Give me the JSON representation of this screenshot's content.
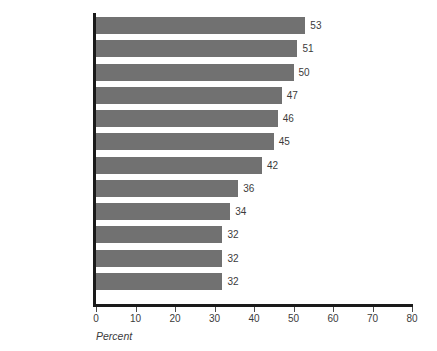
{
  "chart_data": {
    "type": "bar",
    "orientation": "horizontal",
    "title": "",
    "xlabel": "Percent",
    "ylabel": "",
    "categories": [
      "Netherlands",
      "Japan",
      "Sweden",
      "Italy",
      "Germany",
      "Finland",
      "France",
      "Denmark",
      "United States",
      "United Kingdom",
      "Canada",
      "Norway"
    ],
    "values": [
      53,
      51,
      50,
      47,
      46,
      45,
      42,
      36,
      34,
      32,
      32,
      32
    ],
    "value_labels": [
      "53",
      "51",
      "50",
      "47",
      "46",
      "45",
      "42",
      "36",
      "34",
      "32",
      "32",
      "32"
    ],
    "xlim": [
      0,
      80
    ],
    "xticks": [
      0,
      10,
      20,
      30,
      40,
      50,
      60,
      70,
      80
    ],
    "xtick_labels": [
      "0",
      "10",
      "20",
      "30",
      "40",
      "50",
      "60",
      "70",
      "80"
    ],
    "grid": false,
    "legend": null,
    "bar_color": "#717171",
    "axis_color": "#1a1a1a",
    "text_color": "#3b3b3b",
    "background_color": "#ffffff"
  }
}
